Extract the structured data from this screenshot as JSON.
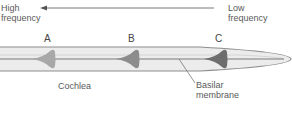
{
  "labels": {
    "high_line1": "High",
    "high_line2": "frequency",
    "low_line1": "Low",
    "low_line2": "frequency",
    "point_a": "A",
    "point_b": "B",
    "point_c": "C",
    "cochlea": "Cochlea",
    "basilar_line1": "Basilar",
    "basilar_line2": "membrane"
  },
  "colors": {
    "cochlea_fill": "#e9e9e9",
    "wave_a": "#a8a8a8",
    "wave_b": "#8a8a8a",
    "wave_c": "#6e6e6e",
    "outline": "#8c8c8c"
  }
}
